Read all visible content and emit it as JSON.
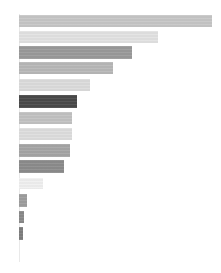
{
  "chart_data": {
    "type": "bar",
    "orientation": "horizontal",
    "title": "",
    "subtitle": "",
    "xlabel": "",
    "ylabel": "",
    "grid": false,
    "legend": null,
    "axis_origin_x": 19,
    "xlim": [
      0,
      200
    ],
    "categories": [
      "1",
      "2",
      "3",
      "4",
      "5",
      "6",
      "7",
      "8",
      "9",
      "10",
      "11",
      "12",
      "13",
      "14"
    ],
    "values": [
      193,
      139,
      113,
      94,
      71,
      58,
      53,
      53,
      51,
      45,
      24,
      8,
      5,
      4
    ],
    "colors": [
      "#c6c6c6",
      "#e2e2e2",
      "#9a9a9a",
      "#b8b8b8",
      "#dcdcdc",
      "#4a4a4a",
      "#c2c2c2",
      "#dedede",
      "#a6a6a6",
      "#8c8c8c",
      "#f0f0f0",
      "#9e9e9e",
      "#8a8a8a",
      "#7e7e7e"
    ],
    "bar_geometry": [
      {
        "y": 15,
        "height": 12,
        "x": 19,
        "width": 193
      },
      {
        "y": 31,
        "height": 12,
        "x": 19,
        "width": 139
      },
      {
        "y": 46,
        "height": 13,
        "x": 19,
        "width": 113
      },
      {
        "y": 62,
        "height": 12,
        "x": 19,
        "width": 94
      },
      {
        "y": 79,
        "height": 12,
        "x": 19,
        "width": 71
      },
      {
        "y": 95,
        "height": 13,
        "x": 19,
        "width": 58
      },
      {
        "y": 112,
        "height": 12,
        "x": 19,
        "width": 53
      },
      {
        "y": 128,
        "height": 12,
        "x": 19,
        "width": 53
      },
      {
        "y": 144,
        "height": 13,
        "x": 19,
        "width": 51
      },
      {
        "y": 160,
        "height": 13,
        "x": 19,
        "width": 45
      },
      {
        "y": 178,
        "height": 11,
        "x": 19,
        "width": 24
      },
      {
        "y": 194,
        "height": 13,
        "x": 19,
        "width": 8
      },
      {
        "y": 211,
        "height": 12,
        "x": 19,
        "width": 5
      },
      {
        "y": 227,
        "height": 13,
        "x": 19,
        "width": 4
      }
    ],
    "axis": {
      "visible": true,
      "x": 19,
      "y_top": 14,
      "y_bottom": 262,
      "color": "#e9e9e9"
    },
    "tick_labels_x": [],
    "tick_labels_y": [],
    "annotations": []
  }
}
